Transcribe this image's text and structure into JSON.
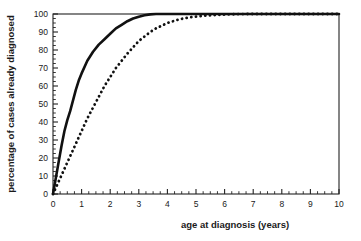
{
  "chart_data": {
    "type": "line",
    "title": "",
    "xlabel": "age at diagnosis (years)",
    "ylabel": "percentage of cases already diagnosed",
    "xlim": [
      0,
      10
    ],
    "ylim": [
      0,
      100
    ],
    "xticks": [
      0,
      1,
      2,
      3,
      4,
      5,
      6,
      7,
      8,
      9,
      10
    ],
    "xtick_labels": [
      "0",
      "1",
      "2",
      "3",
      "4",
      "5",
      "6",
      "7",
      "8",
      "9",
      "10"
    ],
    "xminor_step": 0.25,
    "yticks": [
      0,
      10,
      20,
      30,
      40,
      50,
      60,
      70,
      80,
      90,
      100
    ],
    "ytick_labels": [
      "0",
      "10",
      "20",
      "30",
      "40",
      "50",
      "60",
      "70",
      "80",
      "90",
      "100"
    ],
    "yminor_step": 2.5,
    "grid": false,
    "legend": "none",
    "frame": "box",
    "series": [
      {
        "name": "solid curve",
        "style": "solid",
        "color": "#111111",
        "linewidth": 2.6,
        "x": [
          0,
          0.1,
          0.2,
          0.3,
          0.4,
          0.5,
          0.6,
          0.7,
          0.8,
          0.9,
          1.0,
          1.2,
          1.4,
          1.6,
          1.8,
          2.0,
          2.2,
          2.4,
          2.6,
          2.8,
          3.0,
          3.2,
          3.4,
          3.6,
          4.0,
          5.0,
          6.0,
          7.0,
          8.0,
          9.0,
          10.0
        ],
        "y": [
          0,
          9,
          18,
          27,
          35,
          41,
          46,
          52,
          58,
          63,
          67,
          74,
          79,
          83,
          86,
          89,
          92,
          94,
          96,
          97.5,
          98.5,
          99.3,
          99.8,
          100,
          100,
          100,
          100,
          100,
          100,
          100,
          100
        ]
      },
      {
        "name": "dotted curve",
        "style": "dotted",
        "color": "#111111",
        "linewidth": 2.6,
        "x": [
          0,
          0.2,
          0.4,
          0.6,
          0.8,
          1.0,
          1.2,
          1.4,
          1.6,
          1.8,
          2.0,
          2.2,
          2.4,
          2.6,
          2.8,
          3.0,
          3.2,
          3.4,
          3.6,
          3.8,
          4.0,
          4.4,
          4.8,
          5.2,
          5.6,
          6.0,
          6.4,
          6.8,
          7.2,
          8.0,
          9.0,
          10.0
        ],
        "y": [
          0,
          7,
          14,
          21,
          28,
          35,
          42,
          48,
          54,
          60,
          65,
          70,
          74,
          78,
          81.5,
          85,
          87.5,
          90,
          92,
          93.5,
          95,
          97,
          98.2,
          98.9,
          99.4,
          99.7,
          99.9,
          100,
          100,
          100,
          100,
          100
        ]
      }
    ]
  },
  "axes": {
    "x_axis_label": "age at diagnosis (years)",
    "y_axis_label": "percentage of cases already diagnosed"
  }
}
